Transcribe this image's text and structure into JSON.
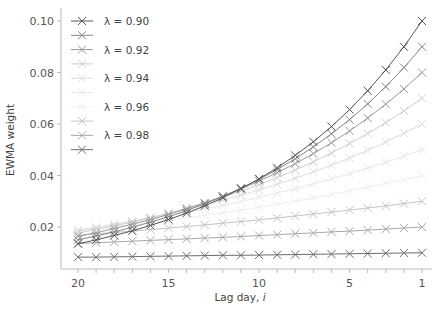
{
  "chart_data": {
    "type": "line",
    "title": "",
    "xlabel": "Lag day, i",
    "ylabel": "EWMA weight",
    "x": [
      1,
      2,
      3,
      4,
      5,
      6,
      7,
      8,
      9,
      10,
      11,
      12,
      13,
      14,
      15,
      16,
      17,
      18,
      19,
      20
    ],
    "x_reversed": true,
    "xlim": [
      20,
      1
    ],
    "ylim": [
      0.006,
      0.102
    ],
    "xticks": [
      20,
      15,
      10,
      5,
      1
    ],
    "yticks": [
      0.02,
      0.04,
      0.06,
      0.08,
      0.1
    ],
    "ytick_labels": [
      "0.02",
      "0.04",
      "0.06",
      "0.08",
      "0.10"
    ],
    "grid": false,
    "legend_position": "upper left",
    "marker": "x",
    "series": [
      {
        "name": "λ = 0.90",
        "show_label": true,
        "color": "#555555",
        "values": [
          0.1,
          0.09,
          0.081,
          0.0729,
          0.0656,
          0.059,
          0.0531,
          0.0478,
          0.043,
          0.0387,
          0.0349,
          0.0314,
          0.0282,
          0.0254,
          0.0229,
          0.0206,
          0.0185,
          0.0167,
          0.015,
          0.0135
        ]
      },
      {
        "name": "λ = 0.91",
        "show_label": false,
        "color": "#888888",
        "values": [
          0.09,
          0.0819,
          0.0745,
          0.0678,
          0.0617,
          0.0562,
          0.0511,
          0.0465,
          0.0423,
          0.0385,
          0.0351,
          0.0319,
          0.029,
          0.0264,
          0.024,
          0.0219,
          0.0199,
          0.0181,
          0.0165,
          0.015
        ]
      },
      {
        "name": "λ = 0.92",
        "show_label": true,
        "color": "#999999",
        "values": [
          0.08,
          0.0736,
          0.0677,
          0.0623,
          0.0573,
          0.0527,
          0.0485,
          0.0446,
          0.0411,
          0.0378,
          0.0348,
          0.032,
          0.0294,
          0.0271,
          0.0249,
          0.0229,
          0.0211,
          0.0194,
          0.0178,
          0.0164
        ]
      },
      {
        "name": "λ = 0.93",
        "show_label": false,
        "color": "#cfcfcf",
        "values": [
          0.07,
          0.0651,
          0.0605,
          0.0563,
          0.0524,
          0.0487,
          0.0453,
          0.0421,
          0.0392,
          0.0364,
          0.0339,
          0.0315,
          0.0293,
          0.0273,
          0.0253,
          0.0236,
          0.0219,
          0.0204,
          0.019,
          0.0176
        ]
      },
      {
        "name": "λ = 0.94",
        "show_label": true,
        "color": "#dcdcdc",
        "values": [
          0.06,
          0.0564,
          0.053,
          0.0498,
          0.0468,
          0.044,
          0.0414,
          0.0389,
          0.0366,
          0.0344,
          0.0323,
          0.0304,
          0.0286,
          0.0268,
          0.0252,
          0.0237,
          0.0223,
          0.021,
          0.0197,
          0.0185
        ]
      },
      {
        "name": "λ = 0.95",
        "show_label": false,
        "color": "#e8e8e8",
        "values": [
          0.05,
          0.0475,
          0.0451,
          0.0429,
          0.0407,
          0.0387,
          0.0368,
          0.0349,
          0.0332,
          0.0315,
          0.0299,
          0.0284,
          0.027,
          0.0257,
          0.0244,
          0.0232,
          0.022,
          0.0209,
          0.0199,
          0.0189
        ]
      },
      {
        "name": "λ = 0.96",
        "show_label": true,
        "color": "#eeeeee",
        "values": [
          0.04,
          0.0384,
          0.0369,
          0.0354,
          0.034,
          0.0326,
          0.0313,
          0.0301,
          0.0289,
          0.0277,
          0.0266,
          0.0255,
          0.0245,
          0.0235,
          0.0226,
          0.0217,
          0.0208,
          0.02,
          0.0192,
          0.0184
        ]
      },
      {
        "name": "λ = 0.97",
        "show_label": false,
        "color": "#c4c4c4",
        "values": [
          0.03,
          0.0291,
          0.0282,
          0.0274,
          0.0266,
          0.0258,
          0.025,
          0.0243,
          0.0235,
          0.0228,
          0.0221,
          0.0215,
          0.0208,
          0.0202,
          0.0196,
          0.019,
          0.0184,
          0.0179,
          0.0173,
          0.0168
        ]
      },
      {
        "name": "λ = 0.98",
        "show_label": true,
        "color": "#a8a8a8",
        "values": [
          0.02,
          0.0196,
          0.0192,
          0.0188,
          0.0184,
          0.0181,
          0.0177,
          0.0174,
          0.017,
          0.0167,
          0.0163,
          0.016,
          0.0157,
          0.0154,
          0.0151,
          0.0148,
          0.0145,
          0.0142,
          0.0139,
          0.0136
        ]
      },
      {
        "name": "λ = 0.99",
        "show_label": false,
        "color": "#6e6e6e",
        "values": [
          0.01,
          0.0099,
          0.0098,
          0.0097,
          0.0096,
          0.0095,
          0.0094,
          0.0093,
          0.0092,
          0.0091,
          0.009,
          0.009,
          0.0089,
          0.0088,
          0.0087,
          0.0086,
          0.0085,
          0.0084,
          0.0083,
          0.0083
        ]
      }
    ]
  },
  "layout": {
    "plot_left": 61,
    "plot_right": 432,
    "plot_top": 8,
    "plot_bottom": 269,
    "x_at_20": 78,
    "x_at_1": 422,
    "y_at_0_10": 21,
    "y_at_0_02": 227
  },
  "axes": {
    "xlabel_text": "Lag day, ",
    "xlabel_var": "i",
    "ylabel_text": "EWMA weight"
  }
}
